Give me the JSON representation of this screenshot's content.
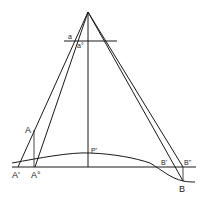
{
  "diagram": {
    "type": "geometric-projection",
    "labels": {
      "a": "a",
      "a0": "a°",
      "A": "A",
      "A_prime": "A'",
      "A_zero": "A°",
      "P_prime": "P'",
      "B_prime": "B'",
      "B_dprime": "B\"",
      "B": "B"
    },
    "points": {
      "apex": [
        88,
        12
      ],
      "A": [
        34,
        130
      ],
      "A_prime": [
        18,
        167
      ],
      "A_zero": [
        35,
        167
      ],
      "P_prime": [
        88,
        153
      ],
      "P_foot": [
        88,
        167
      ],
      "B_prime": [
        173,
        167
      ],
      "B_dprime": [
        183,
        167
      ],
      "B": [
        183,
        181
      ]
    },
    "lines": {
      "image_plane_y": 41,
      "datum_y": 167
    },
    "colors": {
      "ink": "#1a1a1a",
      "background": "#ffffff"
    }
  }
}
